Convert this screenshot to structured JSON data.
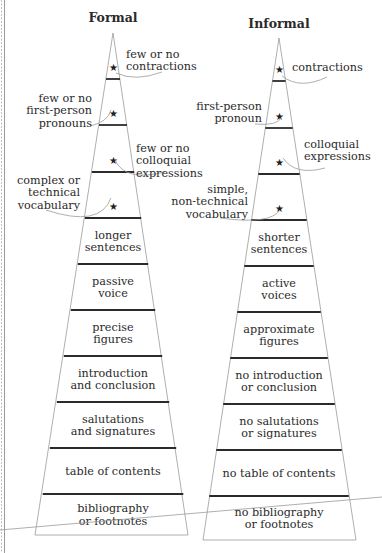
{
  "pyramids": [
    {
      "title": "Formal",
      "starred": [
        {
          "label": [
            "few or no",
            "contractions"
          ]
        },
        {
          "label": [
            "few or no",
            "first-person",
            "pronouns"
          ]
        },
        {
          "label": [
            "few or no",
            "colloquial",
            "expressions"
          ]
        },
        {
          "label": [
            "complex or",
            "technical",
            "vocabulary"
          ]
        }
      ],
      "tiers": [
        {
          "label": [
            "longer",
            "sentences"
          ]
        },
        {
          "label": [
            "passive",
            "voice"
          ]
        },
        {
          "label": [
            "precise",
            "figures"
          ]
        },
        {
          "label": [
            "introduction",
            "and conclusion"
          ]
        },
        {
          "label": [
            "salutations",
            "and signatures"
          ]
        },
        {
          "label": [
            "table of contents"
          ]
        },
        {
          "label": [
            "bibliography",
            "or footnotes"
          ]
        }
      ]
    },
    {
      "title": "Informal",
      "starred": [
        {
          "label": [
            "contractions"
          ]
        },
        {
          "label": [
            "first-person",
            "pronoun"
          ]
        },
        {
          "label": [
            "colloquial",
            "expressions"
          ]
        },
        {
          "label": [
            "simple,",
            "non-technical",
            "vocabulary"
          ]
        }
      ],
      "tiers": [
        {
          "label": [
            "shorter",
            "sentences"
          ]
        },
        {
          "label": [
            "active",
            "voices"
          ]
        },
        {
          "label": [
            "approximate",
            "figures"
          ]
        },
        {
          "label": [
            "no introduction",
            "or conclusion"
          ]
        },
        {
          "label": [
            "no salutations",
            "or signatures"
          ]
        },
        {
          "label": [
            "no table of contents"
          ]
        },
        {
          "label": [
            "no bibliography",
            "or footnotes"
          ]
        }
      ]
    }
  ],
  "icons": {
    "star": "★"
  }
}
